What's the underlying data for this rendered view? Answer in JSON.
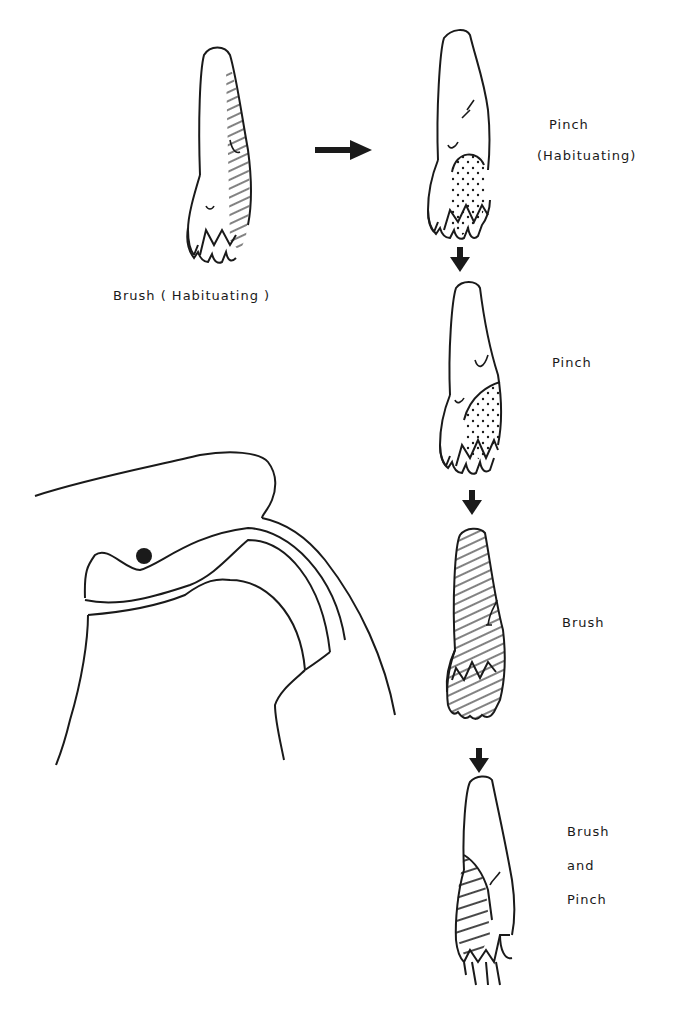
{
  "figure": {
    "panels": [
      {
        "id": "brush-habituating",
        "label": "Brush ( Habituating )",
        "shading": "hatched"
      },
      {
        "id": "pinch-habituating",
        "label_line1": "Pinch",
        "label_line2": "(Habituating)",
        "shading": "dotted"
      },
      {
        "id": "pinch",
        "label": "Pinch",
        "shading": "dotted"
      },
      {
        "id": "brush",
        "label": "Brush",
        "shading": "hatched"
      },
      {
        "id": "brush-and-pinch",
        "label_line1": "Brush",
        "label_line2": "and",
        "label_line3": "Pinch",
        "shading": "cross-hatched"
      }
    ],
    "colors": {
      "ink": "#1a1a1a",
      "background": "#ffffff"
    }
  }
}
